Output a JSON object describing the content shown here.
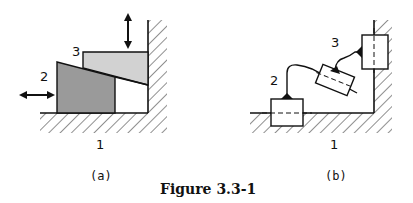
{
  "figure": {
    "caption": "Figure 3.3-1",
    "panels": [
      {
        "id": "a",
        "sublabel": "(a)",
        "labels": {
          "ground": "1",
          "wedge": "2",
          "slider": "3"
        },
        "colors": {
          "wedge": "#9a9a9a",
          "slider": "#d2d2d2"
        }
      },
      {
        "id": "b",
        "sublabel": "(b)",
        "labels": {
          "ground": "1",
          "wedge": "2",
          "slider": "3"
        }
      }
    ]
  }
}
